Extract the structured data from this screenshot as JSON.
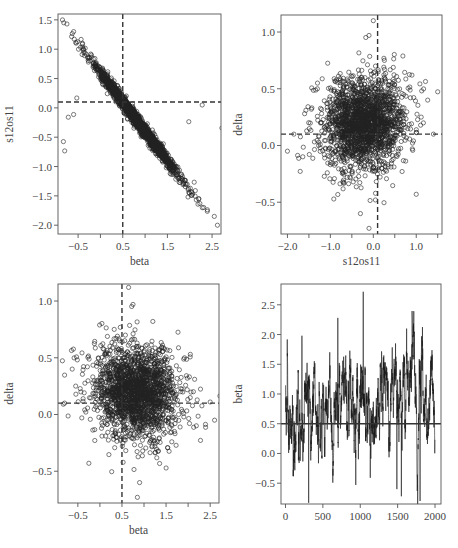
{
  "figure": {
    "width": 458,
    "height": 548,
    "layout": "2x2 grid of MCMC diagnostic plots"
  },
  "chart_data": [
    {
      "id": "p1",
      "type": "scatter",
      "title": "",
      "xlabel": "beta",
      "ylabel": "s12os11",
      "xlim": [
        -0.95,
        2.7
      ],
      "ylim": [
        -2.15,
        1.6
      ],
      "xticks": [
        -0.5,
        0,
        0.5,
        1.0,
        1.5,
        2.0,
        2.5
      ],
      "xtick_labels": [
        "-0.5",
        "",
        "0.5",
        "",
        "1.5",
        "",
        "2.5"
      ],
      "yticks": [
        1.5,
        1.0,
        0.5,
        0.0,
        -0.5,
        -1.0,
        -1.5,
        -2.0
      ],
      "ytick_labels": [
        "1.5",
        "1.0",
        "0.5",
        "0.0",
        "−0.5",
        "−1.0",
        "−1.5",
        "−2.0"
      ],
      "reference_lines": {
        "vertical_x": 0.5,
        "horizontal_y": 0.1,
        "style": "dashed"
      },
      "grid": false,
      "marker": "open-circle",
      "n_points": 2000,
      "relationship": "strong negative linear: s12os11 ≈ 0.6 − 1.0·beta",
      "sample_points": [
        [
          -0.82,
          1.45
        ],
        [
          -0.75,
          1.43
        ],
        [
          -0.6,
          1.3
        ],
        [
          -0.4,
          1.1
        ],
        [
          -0.2,
          0.9
        ],
        [
          0.0,
          0.65
        ],
        [
          0.3,
          0.35
        ],
        [
          0.5,
          0.12
        ],
        [
          0.7,
          -0.05
        ],
        [
          1.0,
          -0.35
        ],
        [
          1.3,
          -0.65
        ],
        [
          1.6,
          -0.95
        ],
        [
          1.9,
          -1.3
        ],
        [
          2.2,
          -1.55
        ],
        [
          2.55,
          -1.85
        ],
        [
          2.62,
          -2.0
        ]
      ]
    },
    {
      "id": "p2",
      "type": "scatter",
      "title": "",
      "xlabel": "s12os11",
      "ylabel": "delta",
      "xlim": [
        -2.15,
        1.6
      ],
      "ylim": [
        -0.78,
        1.15
      ],
      "xticks": [
        -2.0,
        -1.5,
        -1.0,
        -0.5,
        0.0,
        0.5,
        1.0,
        1.5
      ],
      "xtick_labels": [
        "−2.0",
        "",
        "−1.0",
        "",
        "0.0",
        "",
        "1.0",
        ""
      ],
      "yticks": [
        1.0,
        0.5,
        0.0,
        -0.5
      ],
      "ytick_labels": [
        "1.0",
        "0.5",
        "0.0",
        "−0.5"
      ],
      "reference_lines": {
        "vertical_x": 0.1,
        "horizontal_y": 0.1,
        "style": "dashed"
      },
      "grid": false,
      "marker": "open-circle",
      "n_points": 2000,
      "relationship": "roughly elliptical cloud centered near (-0.1, 0.2)",
      "sample_points": [
        [
          -2.0,
          -0.05
        ],
        [
          -1.85,
          0.1
        ],
        [
          -1.6,
          0.28
        ],
        [
          -1.3,
          0.55
        ],
        [
          -0.3,
          -0.6
        ],
        [
          -0.1,
          -0.73
        ],
        [
          0.0,
          1.1
        ],
        [
          -0.1,
          0.97
        ],
        [
          0.05,
          -0.48
        ],
        [
          1.0,
          -0.43
        ],
        [
          1.4,
          0.1
        ],
        [
          0.9,
          0.62
        ]
      ]
    },
    {
      "id": "p3",
      "type": "scatter",
      "title": "",
      "xlabel": "beta",
      "ylabel": "delta",
      "xlim": [
        -0.95,
        2.7
      ],
      "ylim": [
        -0.78,
        1.15
      ],
      "xticks": [
        -0.5,
        0,
        0.5,
        1.0,
        1.5,
        2.0,
        2.5
      ],
      "xtick_labels": [
        "−0.5",
        "",
        "0.5",
        "",
        "1.5",
        "",
        "2.5"
      ],
      "yticks": [
        1.0,
        0.5,
        0.0,
        -0.5
      ],
      "ytick_labels": [
        "1.0",
        "0.5",
        "0.0",
        "−0.5"
      ],
      "reference_lines": {
        "vertical_x": 0.5,
        "horizontal_y": 0.1,
        "style": "dashed"
      },
      "grid": false,
      "marker": "open-circle",
      "n_points": 2000,
      "relationship": "roughly elliptical cloud centered near (0.7, 0.2)",
      "sample_points": [
        [
          0.65,
          1.12
        ],
        [
          0.75,
          0.97
        ],
        [
          0.85,
          -0.73
        ],
        [
          0.9,
          -0.6
        ],
        [
          -0.8,
          0.1
        ],
        [
          2.6,
          -0.05
        ],
        [
          2.5,
          0.11
        ],
        [
          2.05,
          0.53
        ],
        [
          -0.25,
          -0.43
        ],
        [
          1.2,
          0.82
        ]
      ]
    },
    {
      "id": "p4",
      "type": "line",
      "title": "",
      "xlabel": "",
      "ylabel": "beta",
      "xlim": [
        -60,
        2080
      ],
      "ylim": [
        -0.85,
        2.85
      ],
      "xticks": [
        0,
        500,
        1000,
        1500,
        2000
      ],
      "xtick_labels": [
        "0",
        "500",
        "1000",
        "1500",
        "2000"
      ],
      "yticks": [
        2.5,
        2.0,
        1.5,
        1.0,
        0.5,
        0.0,
        -0.5
      ],
      "ytick_labels": [
        "2.5",
        "2.0",
        "1.5",
        "1.0",
        "0.5",
        "0.0",
        "−0.5"
      ],
      "reference_lines": {
        "horizontal_y": 0.5,
        "style": "solid"
      },
      "grid": false,
      "description": "MCMC trace of beta over 2000 iterations, mean ≈ 0.75",
      "n_points": 2000,
      "notable_points": [
        [
          1040,
          2.72
        ],
        [
          700,
          2.28
        ],
        [
          1620,
          2.1
        ],
        [
          220,
          1.98
        ],
        [
          310,
          -0.83
        ],
        [
          1800,
          -0.8
        ],
        [
          940,
          -0.53
        ],
        [
          1550,
          -0.72
        ],
        [
          1490,
          -0.6
        ]
      ]
    }
  ],
  "panels": [
    {
      "id": "p1",
      "box": {
        "x": 58,
        "y": 14,
        "w": 163,
        "h": 220
      }
    },
    {
      "id": "p2",
      "box": {
        "x": 281,
        "y": 15,
        "w": 161,
        "h": 219
      }
    },
    {
      "id": "p3",
      "box": {
        "x": 58,
        "y": 284,
        "w": 161,
        "h": 219
      }
    },
    {
      "id": "p4",
      "box": {
        "x": 281,
        "y": 284,
        "w": 160,
        "h": 220
      }
    }
  ],
  "colors": {
    "axis": "#555555",
    "points": "#222222",
    "reference": "#333333",
    "trace": "#1a1a1a"
  }
}
